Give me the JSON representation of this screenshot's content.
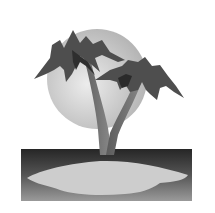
{
  "image": {
    "subject": "palm-tree-island-clipart",
    "style": "grayscale",
    "elements": [
      "sun",
      "two-palm-trees",
      "sea",
      "sand-island"
    ]
  },
  "colors": {
    "background": "#ffffff",
    "sun_light": "#e8e8e8",
    "sun_dark": "#b8b8b8",
    "frond_dark": "#3a3a3a",
    "frond_mid": "#5a5a5a",
    "trunk": "#6e6e6e",
    "sea_dark": "#2a2a2a",
    "sea_light": "#8a8a8a",
    "sand": "#cfcfcf"
  }
}
